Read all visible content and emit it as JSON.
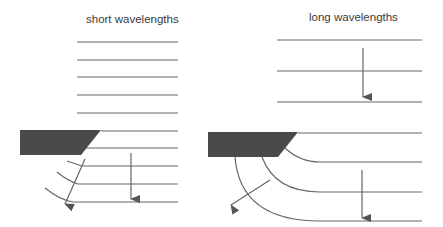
{
  "labels": {
    "short": "short wavelengths",
    "long": "long wavelengths"
  },
  "colors": {
    "line": "#666666",
    "block": "#4a4a4a",
    "text": "#3a3a3a"
  }
}
